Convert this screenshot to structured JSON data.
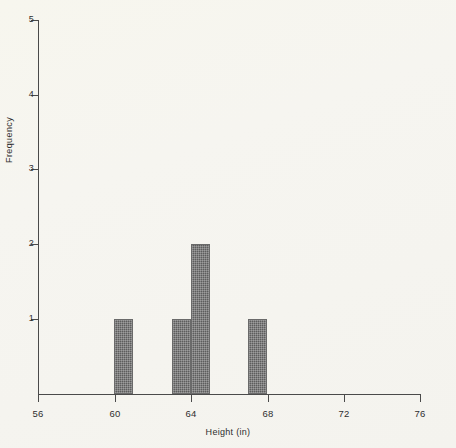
{
  "chart_data": {
    "type": "bar",
    "title": "",
    "subtitle": "",
    "xlabel": "Height (in)",
    "ylabel": "Frequency",
    "xlim": [
      56,
      76
    ],
    "ylim": [
      0,
      5
    ],
    "grid": false,
    "legend": null,
    "x_ticks": [
      "56",
      "60",
      "64",
      "68",
      "72",
      "76"
    ],
    "x_tick_values": [
      56,
      60,
      64,
      68,
      72,
      76
    ],
    "y_ticks": [
      "1",
      "2",
      "3",
      "4",
      "5"
    ],
    "y_tick_values": [
      1,
      2,
      3,
      4,
      5
    ],
    "bin_width": 1,
    "categories": [
      "60",
      "63",
      "64",
      "67"
    ],
    "values": [
      1,
      1,
      2,
      1
    ],
    "bars": [
      {
        "label": "60",
        "bin_start": 60,
        "bin_end": 61,
        "value": 1
      },
      {
        "label": "63",
        "bin_start": 63,
        "bin_end": 64,
        "value": 1
      },
      {
        "label": "64",
        "bin_start": 64,
        "bin_end": 65,
        "value": 2
      },
      {
        "label": "67",
        "bin_start": 67,
        "bin_end": 68,
        "value": 1
      }
    ],
    "colors": {
      "bar_fill": "#5d5d5d",
      "bar_edge": "#6a6a6a",
      "axis": "#4a4a4a",
      "background": "#f6f5ef",
      "text": "#2e2e2e"
    }
  }
}
